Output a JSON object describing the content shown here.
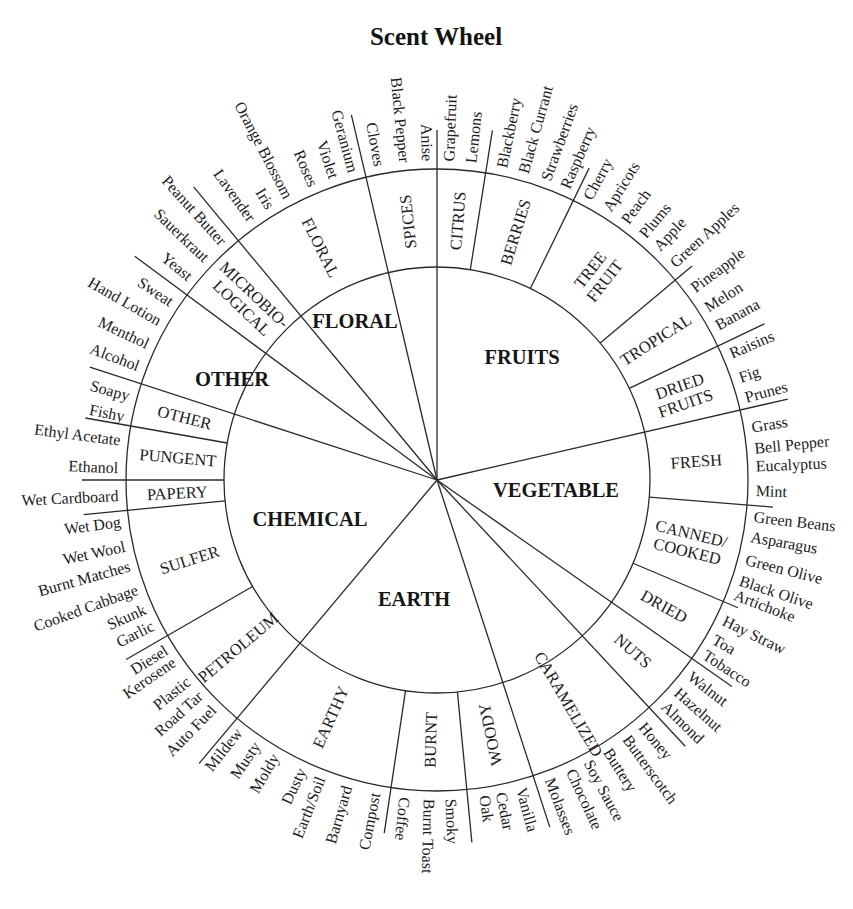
{
  "title": "Scent Wheel",
  "wheel": {
    "categories": [
      {
        "name": "FLORAL",
        "start_deg": 320,
        "end_deg": 360,
        "subcategories": [
          {
            "lines": [
              "FLORAL"
            ],
            "start_deg": 320,
            "end_deg": 347,
            "descriptors": [
              {
                "label": "Lavender",
                "deg": 324.6
              },
              {
                "label": "Iris",
                "deg": 328.6
              },
              {
                "label": "Orange Blossom",
                "deg": 332.3
              },
              {
                "label": "Roses",
                "deg": 337.2
              },
              {
                "label": "Violet",
                "deg": 341.2
              },
              {
                "label": "Geranium",
                "deg": 344.8
              }
            ]
          },
          {
            "lines": [
              "SPICES"
            ],
            "start_deg": 347,
            "end_deg": 360,
            "descriptors": [
              {
                "label": "Cloves",
                "deg": 349.6
              },
              {
                "label": "Black Pepper",
                "deg": 354.2
              },
              {
                "label": "Anise",
                "deg": 358.3
              }
            ]
          }
        ]
      },
      {
        "name": "FRUITS",
        "start_deg": 0,
        "end_deg": 77,
        "subcategories": [
          {
            "lines": [
              "CITRUS"
            ],
            "start_deg": 0,
            "end_deg": 9,
            "descriptors": [
              {
                "label": "Grapefruit",
                "deg": 2.1
              },
              {
                "label": "Lemons",
                "deg": 6.1
              }
            ]
          },
          {
            "lines": [
              "BERRIES"
            ],
            "start_deg": 9,
            "end_deg": 26,
            "descriptors": [
              {
                "label": "Blackberry",
                "deg": 11.7
              },
              {
                "label": "Black Currant",
                "deg": 15.7
              },
              {
                "label": "Strawberries",
                "deg": 19.9
              },
              {
                "label": "Raspberry",
                "deg": 23.6
              }
            ]
          },
          {
            "lines": [
              "TREE",
              "FRUIT"
            ],
            "start_deg": 26,
            "end_deg": 50,
            "descriptors": [
              {
                "label": "Cherry",
                "deg": 28.1
              },
              {
                "label": "Apricots",
                "deg": 32.1
              },
              {
                "label": "Peach",
                "deg": 36.0
              },
              {
                "label": "Plums",
                "deg": 40.0
              },
              {
                "label": "Apple",
                "deg": 43.4
              },
              {
                "label": "Green Apples",
                "deg": 47.5
              }
            ]
          },
          {
            "lines": [
              "TROPICAL"
            ],
            "start_deg": 50,
            "end_deg": 64.5,
            "descriptors": [
              {
                "label": "Pineapple",
                "deg": 53.2
              },
              {
                "label": "Melon",
                "deg": 57.4
              },
              {
                "label": "Banana",
                "deg": 61.1
              }
            ]
          },
          {
            "lines": [
              "DRIED",
              "FRUITS"
            ],
            "start_deg": 64.5,
            "end_deg": 77,
            "descriptors": [
              {
                "label": "Raisins",
                "deg": 66.7
              },
              {
                "label": "Fig",
                "deg": 71.3
              },
              {
                "label": "Prunes",
                "deg": 75.0
              }
            ]
          }
        ]
      },
      {
        "name": "VEGETABLE",
        "start_deg": 77,
        "end_deg": 125,
        "subcategories": [
          {
            "lines": [
              "FRESH"
            ],
            "start_deg": 77,
            "end_deg": 94.6,
            "descriptors": [
              {
                "label": "Grass",
                "deg": 80.5
              },
              {
                "label": "Bell Pepper",
                "deg": 84.3
              },
              {
                "label": "Eucalyptus",
                "deg": 87.5
              },
              {
                "label": "Mint",
                "deg": 91.9
              }
            ]
          },
          {
            "lines": [
              "CANNED/",
              "COOKED"
            ],
            "start_deg": 94.6,
            "end_deg": 113,
            "descriptors": [
              {
                "label": "Green Beans",
                "deg": 96.6
              },
              {
                "label": "Asparagus",
                "deg": 100.2
              },
              {
                "label": "Green Olive",
                "deg": 104.4
              },
              {
                "label": "Black Olive",
                "deg": 108.3
              },
              {
                "label": "Artichoke",
                "deg": 111.0
              }
            ]
          },
          {
            "lines": [
              "DRIED"
            ],
            "start_deg": 113,
            "end_deg": 125,
            "descriptors": [
              {
                "label": "Hay Straw",
                "deg": 116.0
              },
              {
                "label": "Toa",
                "deg": 119.8
              },
              {
                "label": "Tobacco",
                "deg": 123.0
              }
            ]
          }
        ]
      },
      {
        "name": "EARTH",
        "start_deg": 125,
        "end_deg": 220,
        "subcategories": [
          {
            "lines": [
              "NUTS"
            ],
            "start_deg": 125,
            "end_deg": 137,
            "descriptors": [
              {
                "label": "Walnut",
                "deg": 127.6
              },
              {
                "label": "Hazelnut",
                "deg": 131.3
              },
              {
                "label": "Almond",
                "deg": 134.6
              }
            ]
          },
          {
            "lines": [
              "CARAMELIZED"
            ],
            "start_deg": 137,
            "end_deg": 162,
            "descriptors": [
              {
                "label": "Honey",
                "deg": 140.0
              },
              {
                "label": "Butterscotch",
                "deg": 143.6
              },
              {
                "label": "Buttery",
                "deg": 147.7
              },
              {
                "label": "Soy Sauce",
                "deg": 151.7
              },
              {
                "label": "Chocolate",
                "deg": 155.2
              },
              {
                "label": "Molasses",
                "deg": 159.3
              }
            ]
          },
          {
            "lines": [
              "WOODY"
            ],
            "start_deg": 162,
            "end_deg": 174.5,
            "descriptors": [
              {
                "label": "Vanilla",
                "deg": 164.7
              },
              {
                "label": "Cedar",
                "deg": 168.4
              },
              {
                "label": "Oak",
                "deg": 171.4
              }
            ]
          },
          {
            "lines": [
              "BURNT"
            ],
            "start_deg": 174.5,
            "end_deg": 188.5,
            "descriptors": [
              {
                "label": "Smoky",
                "deg": 177.5
              },
              {
                "label": "Burnt Toast",
                "deg": 181.4
              },
              {
                "label": "Coffee",
                "deg": 185.8
              }
            ]
          },
          {
            "lines": [
              "EARTHY"
            ],
            "start_deg": 188.5,
            "end_deg": 220,
            "descriptors": [
              {
                "label": "Compost",
                "deg": 191.2
              },
              {
                "label": "Barnyard",
                "deg": 196.4
              },
              {
                "label": "Earth/Soil",
                "deg": 201.4
              },
              {
                "label": "Dusty",
                "deg": 205.1
              },
              {
                "label": "Moldy",
                "deg": 210.5
              },
              {
                "label": "Musty",
                "deg": 214.4
              },
              {
                "label": "Mildew",
                "deg": 218.4
              }
            ]
          }
        ]
      },
      {
        "name": "CHEMICAL",
        "start_deg": 220,
        "end_deg": 288,
        "subcategories": [
          {
            "lines": [
              "PETROLEUM"
            ],
            "start_deg": 220,
            "end_deg": 240,
            "descriptors": [
              {
                "label": "Auto Fuel",
                "deg": 224.5
              },
              {
                "label": "Road Tar",
                "deg": 227.9
              },
              {
                "label": "Plastic",
                "deg": 231.2
              },
              {
                "label": "Kerosene",
                "deg": 235.5
              },
              {
                "label": "Diesel",
                "deg": 238.0
              }
            ]
          },
          {
            "lines": [
              "SULFER"
            ],
            "start_deg": 240,
            "end_deg": 264.4,
            "descriptors": [
              {
                "label": "Garlic",
                "deg": 243.0
              },
              {
                "label": "Skunk",
                "deg": 246.2
              },
              {
                "label": "Cooked Cabbage",
                "deg": 250.0
              },
              {
                "label": "Burnt Matches",
                "deg": 254.4
              },
              {
                "label": "Wet Wool",
                "deg": 258.0
              },
              {
                "label": "Wet Dog",
                "deg": 262.5
              }
            ]
          },
          {
            "lines": [
              "PAPERY"
            ],
            "start_deg": 264.4,
            "end_deg": 270,
            "descriptors": [
              {
                "label": "Wet Cardboard",
                "deg": 267.2
              }
            ]
          },
          {
            "lines": [
              "PUNGENT"
            ],
            "start_deg": 270,
            "end_deg": 280,
            "descriptors": [
              {
                "label": "Ethanol",
                "deg": 272.2
              },
              {
                "label": "Ethyl Acetate",
                "deg": 277.2
              }
            ]
          }
        ]
      },
      {
        "name": "OTHER",
        "start_deg": 288,
        "end_deg": 320,
        "subcategories": [
          {
            "lines": [
              "OTHER"
            ],
            "start_deg": 280,
            "end_deg": 307,
            "label_deg": 284,
            "descriptors": [
              {
                "label": "Fishy",
                "deg": 281.5
              },
              {
                "label": "Soapy",
                "deg": 285.3
              },
              {
                "label": "Alcohol",
                "deg": 290.9
              },
              {
                "label": "Menthol",
                "deg": 295.2
              },
              {
                "label": "Hand Lotion",
                "deg": 299.8
              },
              {
                "label": "Sweat",
                "deg": 303.8
              }
            ]
          },
          {
            "lines": [
              "MICROBIO-",
              "LOGICAL"
            ],
            "start_deg": 307,
            "end_deg": 320,
            "descriptors": [
              {
                "label": "Yeast",
                "deg": 309.4
              },
              {
                "label": "Sauerkraut",
                "deg": 313.8
              },
              {
                "label": "Peanut Butter",
                "deg": 318.0
              }
            ]
          }
        ]
      }
    ],
    "dividers": [
      {
        "deg": 0,
        "from_center": true,
        "tick_r": 350
      },
      {
        "deg": 9,
        "from_center": false,
        "tick_r": 354
      },
      {
        "deg": 26,
        "from_center": false,
        "tick_r": 347
      },
      {
        "deg": 50,
        "from_center": false,
        "tick_r": 333
      },
      {
        "deg": 64.5,
        "from_center": false,
        "tick_r": 363
      },
      {
        "deg": 77,
        "from_center": true,
        "tick_r": 360
      },
      {
        "deg": 94.6,
        "from_center": false,
        "tick_r": 337
      },
      {
        "deg": 113,
        "from_center": false,
        "tick_r": 327
      },
      {
        "deg": 125,
        "from_center": true,
        "tick_r": 360
      },
      {
        "deg": 137,
        "from_center": true,
        "tick_r": 364
      },
      {
        "deg": 162,
        "from_center": true,
        "tick_r": 365
      },
      {
        "deg": 174.5,
        "from_center": false,
        "tick_r": 364
      },
      {
        "deg": 188.5,
        "from_center": false,
        "tick_r": 357
      },
      {
        "deg": 220,
        "from_center": true,
        "tick_r": 370
      },
      {
        "deg": 240,
        "from_center": false,
        "tick_r": 359
      },
      {
        "deg": 264.4,
        "from_center": false,
        "tick_r": 355
      },
      {
        "deg": 270,
        "from_center": false,
        "tick_r": 355
      },
      {
        "deg": 280,
        "from_center": false,
        "tick_r": 357
      },
      {
        "deg": 288,
        "from_center": true,
        "tick_r": 365
      },
      {
        "deg": 306.5,
        "from_center": true,
        "tick_r": 376
      },
      {
        "deg": 320.3,
        "from_center": true,
        "tick_r": 381
      },
      {
        "deg": 346.8,
        "from_center": true,
        "tick_r": 375
      }
    ]
  }
}
